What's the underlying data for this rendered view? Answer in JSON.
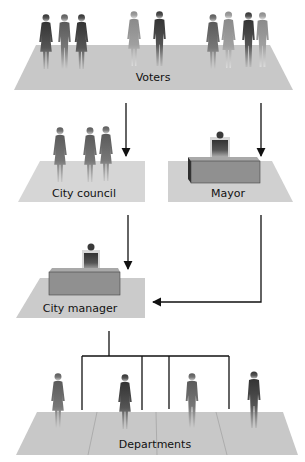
{
  "nodes": {
    "voters": {
      "label": "Voters"
    },
    "city_council": {
      "label": "City council"
    },
    "mayor": {
      "label": "Mayor"
    },
    "city_manager": {
      "label": "City manager"
    },
    "departments": {
      "label": "Departments"
    }
  },
  "edges": [
    {
      "from": "voters",
      "to": "city_council"
    },
    {
      "from": "voters",
      "to": "mayor"
    },
    {
      "from": "city_council",
      "to": "city_manager"
    },
    {
      "from": "mayor",
      "to": "city_manager"
    },
    {
      "from": "city_manager",
      "to": "departments",
      "type": "bracket"
    }
  ],
  "colors": {
    "platform": "#c8c8c8",
    "platform_light": "#d6d6d6",
    "desk_front": "#8f8f8f",
    "desk_top": "#b0b0b0",
    "figure_dark": "#3e3e3e",
    "figure_mid": "#6a6a6a",
    "figure_light": "#9a9a9a",
    "line": "#111111"
  }
}
